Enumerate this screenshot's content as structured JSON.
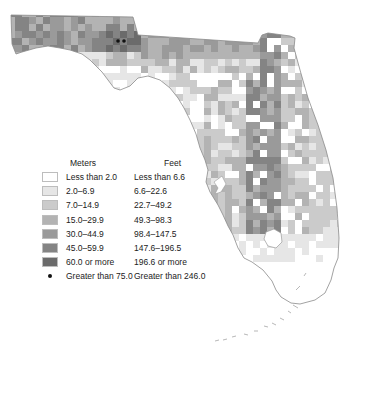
{
  "legend": {
    "header_meters": "Meters",
    "header_feet": "Feet",
    "classes": [
      {
        "meters": "Less than 2.0",
        "feet": "Less than 6.6",
        "color": "#ffffff"
      },
      {
        "meters": "2.0–6.9",
        "feet": "6.6–22.6",
        "color": "#e6e6e6"
      },
      {
        "meters": "7.0–14.9",
        "feet": "22.7–49.2",
        "color": "#cbcbcb"
      },
      {
        "meters": "15.0–29.9",
        "feet": "49.3–98.3",
        "color": "#b3b3b3"
      },
      {
        "meters": "30.0–44.9",
        "feet": "98.4–147.5",
        "color": "#9a9a9a"
      },
      {
        "meters": "45.0–59.9",
        "feet": "147.6–196.5",
        "color": "#848484"
      },
      {
        "meters": "60.0 or more",
        "feet": "196.6 or more",
        "color": "#6b6b6b"
      }
    ],
    "point_symbol": {
      "meters": "Greater than 75.0",
      "feet": "Greater than 246.0",
      "color": "#111111"
    }
  },
  "map": {
    "outline_color": "#8a8a8a",
    "high_points": [
      {
        "x": 118,
        "y": 41
      },
      {
        "x": 124,
        "y": 41
      }
    ]
  }
}
